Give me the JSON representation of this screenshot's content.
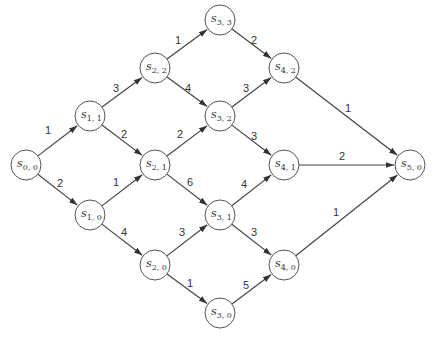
{
  "diagram": {
    "type": "weighted directed graph (stage network)",
    "node_radius": 15,
    "nodes": [
      {
        "id": "s00",
        "label": "s",
        "sub": "0, 0",
        "x": 26,
        "y": 165
      },
      {
        "id": "s11",
        "label": "s",
        "sub": "1, 1",
        "x": 90,
        "y": 116
      },
      {
        "id": "s10",
        "label": "s",
        "sub": "1, 0",
        "x": 90,
        "y": 215
      },
      {
        "id": "s22",
        "label": "s",
        "sub": "2, 2",
        "x": 155,
        "y": 68
      },
      {
        "id": "s21",
        "label": "s",
        "sub": "2, 1",
        "x": 155,
        "y": 165
      },
      {
        "id": "s20",
        "label": "s",
        "sub": "2, 0",
        "x": 155,
        "y": 265
      },
      {
        "id": "s33",
        "label": "s",
        "sub": "3, 3",
        "x": 220,
        "y": 20
      },
      {
        "id": "s32",
        "label": "s",
        "sub": "3, 2",
        "x": 220,
        "y": 116
      },
      {
        "id": "s31",
        "label": "s",
        "sub": "3, 1",
        "x": 220,
        "y": 215
      },
      {
        "id": "s30",
        "label": "s",
        "sub": "3, 0",
        "x": 220,
        "y": 313
      },
      {
        "id": "s42",
        "label": "s",
        "sub": "4, 2",
        "x": 284,
        "y": 68
      },
      {
        "id": "s41",
        "label": "s",
        "sub": "4, 1",
        "x": 284,
        "y": 165
      },
      {
        "id": "s40",
        "label": "s",
        "sub": "4, 0",
        "x": 284,
        "y": 265
      },
      {
        "id": "s50",
        "label": "s",
        "sub": "5, 0",
        "x": 410,
        "y": 165
      }
    ],
    "edges": [
      {
        "from": "s00",
        "to": "s11",
        "weight": "1",
        "lx": 48,
        "ly": 134
      },
      {
        "from": "s00",
        "to": "s10",
        "weight": "2",
        "lx": 60,
        "ly": 187
      },
      {
        "from": "s11",
        "to": "s22",
        "weight": "3",
        "lx": 116,
        "ly": 92
      },
      {
        "from": "s11",
        "to": "s21",
        "weight": "2",
        "lx": 124,
        "ly": 138
      },
      {
        "from": "s10",
        "to": "s21",
        "weight": "1",
        "lx": 116,
        "ly": 186
      },
      {
        "from": "s10",
        "to": "s20",
        "weight": "4",
        "lx": 124,
        "ly": 236
      },
      {
        "from": "s22",
        "to": "s33",
        "weight": "1",
        "lx": 178,
        "ly": 44
      },
      {
        "from": "s22",
        "to": "s32",
        "weight": "4",
        "lx": 188,
        "ly": 92
      },
      {
        "from": "s21",
        "to": "s32",
        "weight": "2",
        "lx": 180,
        "ly": 138
      },
      {
        "from": "s21",
        "to": "s31",
        "weight": "6",
        "lx": 190,
        "ly": 186
      },
      {
        "from": "s20",
        "to": "s31",
        "weight": "3",
        "lx": 182,
        "ly": 236
      },
      {
        "from": "s20",
        "to": "s30",
        "weight": "1",
        "lx": 190,
        "ly": 287
      },
      {
        "from": "s33",
        "to": "s42",
        "weight": "2",
        "lx": 254,
        "ly": 44
      },
      {
        "from": "s32",
        "to": "s42",
        "weight": "3",
        "lx": 246,
        "ly": 92
      },
      {
        "from": "s32",
        "to": "s41",
        "weight": "3",
        "lx": 254,
        "ly": 140
      },
      {
        "from": "s31",
        "to": "s41",
        "weight": "4",
        "lx": 244,
        "ly": 188
      },
      {
        "from": "s31",
        "to": "s40",
        "weight": "3",
        "lx": 254,
        "ly": 236
      },
      {
        "from": "s30",
        "to": "s40",
        "weight": "5",
        "lx": 246,
        "ly": 289
      },
      {
        "from": "s42",
        "to": "s50",
        "weight": "1",
        "lx": 348,
        "ly": 112
      },
      {
        "from": "s41",
        "to": "s50",
        "weight": "2",
        "lx": 342,
        "ly": 160
      },
      {
        "from": "s40",
        "to": "s50",
        "weight": "1",
        "lx": 336,
        "ly": 216
      }
    ]
  }
}
